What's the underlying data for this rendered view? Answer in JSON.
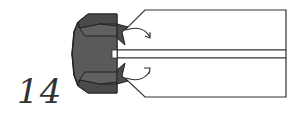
{
  "diagram": {
    "step_number": "14",
    "colors": {
      "paper_white": "#ffffff",
      "paper_colored": "#555555",
      "paper_colored_dark": "#3e3e3e",
      "line": "#333333",
      "arrow": "#333333"
    },
    "elements": [
      {
        "name": "folded-model-left-colored",
        "description": "dark colored folded layers on left"
      },
      {
        "name": "white-strip-upper",
        "description": "upper white flap with angled corner"
      },
      {
        "name": "white-strip-lower",
        "description": "lower white flap with angled corner"
      },
      {
        "name": "center-strip",
        "description": "narrow center strip"
      },
      {
        "name": "fold-arrow-upper",
        "description": "curved arrow indicating fold down"
      },
      {
        "name": "fold-arrow-lower",
        "description": "curved arrow indicating fold up"
      }
    ]
  }
}
